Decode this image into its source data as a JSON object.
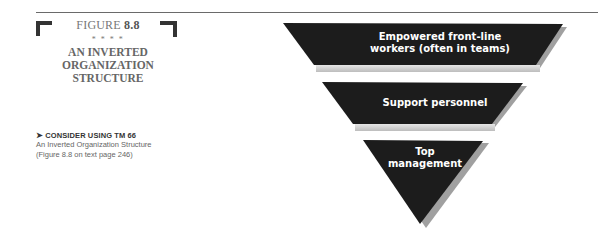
{
  "figure": {
    "label_prefix": "FIGURE ",
    "label_number": "8.8",
    "ornament": "* * * *",
    "title_lines": [
      "AN INVERTED",
      "ORGANIZATION",
      "STRUCTURE"
    ]
  },
  "note": {
    "arrow": "➤",
    "heading": "CONSIDER USING TM 66",
    "line1": "An Inverted Organization Structure",
    "line2": "(Figure 8.8 on text page 246)"
  },
  "diagram": {
    "levels": [
      {
        "line1": "Empowered front-line",
        "line2": "workers (often in teams)"
      },
      {
        "line1": "Support personnel"
      },
      {
        "line1": "Top",
        "line2": "management"
      }
    ],
    "fill_color": "#1c1c1c",
    "shadow_color": "#9a9a9a"
  }
}
